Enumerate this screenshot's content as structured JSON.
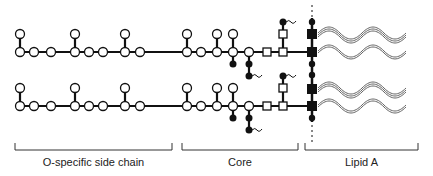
{
  "sections": [
    {
      "id": "o-chain",
      "label": "O-specific side chain",
      "bracket": [
        15,
        172
      ],
      "label_x": 93
    },
    {
      "id": "core",
      "label": "Core",
      "bracket": [
        182,
        298
      ],
      "label_x": 240
    },
    {
      "id": "lipid-a",
      "label": "Lipid A",
      "bracket": [
        305,
        418
      ],
      "label_x": 361
    }
  ],
  "colors": {
    "line": "#111111",
    "fill_open": "#ffffff",
    "fill_solid": "#111111",
    "fatty_acid": "#555555"
  },
  "chains": [
    {
      "main_y": 52,
      "branch_y": 34
    },
    {
      "main_y": 106,
      "branch_y": 89
    }
  ],
  "legend_symbols": {
    "open_circle": "sugar residue",
    "open_square": "Kdo / heptose",
    "solid_circle": "phosphate",
    "solid_square": "glucosamine",
    "wavy_line": "fatty acid chain"
  }
}
